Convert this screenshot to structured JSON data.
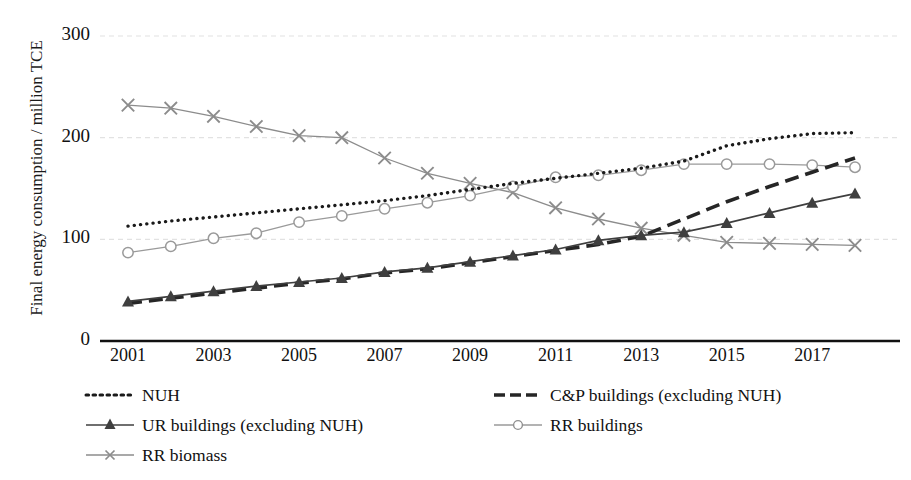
{
  "chart_data": {
    "type": "line",
    "title": "",
    "xlabel": "",
    "ylabel": "Final energy consumption / million TCE",
    "x": [
      2001,
      2002,
      2003,
      2004,
      2005,
      2006,
      2007,
      2008,
      2009,
      2010,
      2011,
      2012,
      2013,
      2014,
      2015,
      2016,
      2017,
      2018
    ],
    "xlim": [
      2001,
      2018
    ],
    "ylim": [
      0,
      300
    ],
    "yticks": [
      0,
      100,
      200,
      300
    ],
    "xticks": [
      2001,
      2003,
      2005,
      2007,
      2009,
      2011,
      2013,
      2015,
      2017
    ],
    "grid": "horizontal-dashed-light",
    "legend_position": "bottom",
    "series": [
      {
        "name": "NUH",
        "style": "dotted",
        "marker": "none",
        "color": "#1a1a1a",
        "values": [
          113,
          118,
          122,
          126,
          130,
          134,
          138,
          143,
          149,
          155,
          160,
          165,
          170,
          177,
          192,
          199,
          204,
          205
        ]
      },
      {
        "name": "C&P buildings (excluding NUH)",
        "style": "dashed",
        "marker": "none",
        "color": "#262626",
        "values": [
          37,
          42,
          47,
          52,
          57,
          61,
          67,
          71,
          77,
          83,
          89,
          95,
          103,
          120,
          137,
          152,
          166,
          180
        ]
      },
      {
        "name": "UR buildings (excluding NUH)",
        "style": "solid",
        "marker": "triangle",
        "color": "#3f3f3f",
        "values": [
          39,
          44,
          49,
          54,
          58,
          62,
          68,
          72,
          78,
          84,
          90,
          99,
          104,
          107,
          116,
          126,
          136,
          145
        ]
      },
      {
        "name": "RR buildings",
        "style": "solid",
        "marker": "circle",
        "color": "#9a9a9a",
        "values": [
          87,
          93,
          101,
          106,
          117,
          123,
          130,
          136,
          143,
          152,
          161,
          163,
          168,
          174,
          174,
          174,
          173,
          171
        ]
      },
      {
        "name": "RR biomass",
        "style": "solid",
        "marker": "x",
        "color": "#8c8c8c",
        "values": [
          232,
          229,
          221,
          211,
          202,
          200,
          180,
          165,
          155,
          146,
          131,
          120,
          111,
          104,
          97,
          96,
          95,
          94
        ]
      }
    ]
  },
  "axis": {
    "y_ticks": [
      "300",
      "200",
      "100",
      "0"
    ],
    "x_ticks": [
      "2001",
      "2003",
      "2005",
      "2007",
      "2009",
      "2011",
      "2013",
      "2015",
      "2017"
    ],
    "y_title": "Final energy consumption / million TCE"
  },
  "legend": {
    "items": [
      {
        "label": "NUH",
        "key": "dotted-line-key"
      },
      {
        "label": "C&P buildings (excluding NUH)",
        "key": "dashed-line-key"
      },
      {
        "label": "UR buildings (excluding NUH)",
        "key": "triangle-marker-line-key"
      },
      {
        "label": "RR buildings",
        "key": "circle-marker-line-key"
      },
      {
        "label": "RR biomass",
        "key": "x-marker-line-key"
      }
    ]
  },
  "colors": {
    "nuh": "#1a1a1a",
    "cp": "#262626",
    "ur": "#3f3f3f",
    "rr_buildings": "#9a9a9a",
    "rr_biomass": "#8c8c8c",
    "axis": "#111111",
    "grid": "#e2e2e2"
  }
}
